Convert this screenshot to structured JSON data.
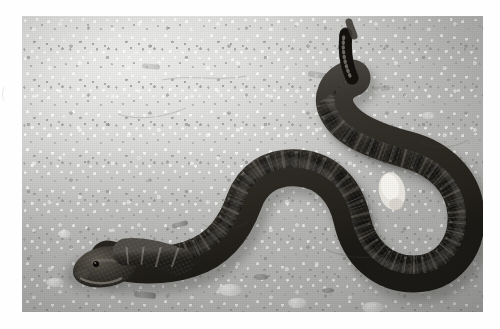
{
  "page": {
    "background_color": "#ffffff",
    "width": 500,
    "height": 329,
    "media_type": "black-and-white photograph"
  },
  "photo": {
    "caption": "",
    "alt_text": "Black-and-white photograph of a rattlesnake coiled in an S-shape on sandy gravel ground",
    "frame": {
      "x": 22,
      "y": 16,
      "width": 461,
      "height": 296
    },
    "border_color": "#ffffff",
    "tone": "grayscale"
  },
  "scene": {
    "subject": "rattlesnake",
    "subject_color": "#2e2b28",
    "pattern_color": "#d8d4cc",
    "ground_label": "gravel and sand ground",
    "ground_color": "#dededc",
    "ground_shadow_color": "#b4b4b2",
    "lighting": "bright daylight from upper left",
    "parts": [
      {
        "name": "head",
        "label": "snake head"
      },
      {
        "name": "neck",
        "label": "snake neck"
      },
      {
        "name": "body",
        "label": "snake body"
      },
      {
        "name": "coil",
        "label": "snake coil loop"
      },
      {
        "name": "rattle",
        "label": "tail rattle"
      }
    ]
  },
  "artifacts": {
    "left_margin_mark": "faint scan edge mark"
  }
}
